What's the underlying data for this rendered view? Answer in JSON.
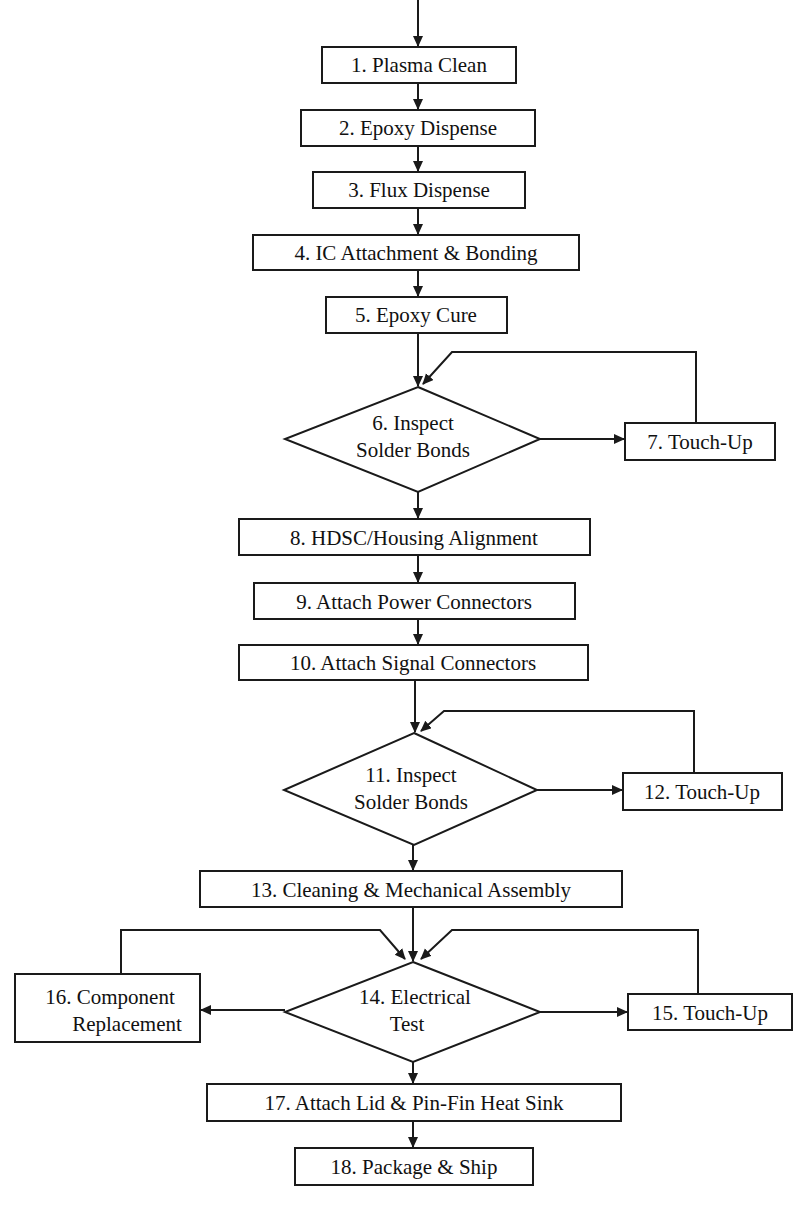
{
  "diagram": {
    "type": "process-flowchart",
    "colors": {
      "line": "#1a1a1a",
      "text": "#111111",
      "background": "#ffffff"
    },
    "nodes": [
      {
        "id": "1",
        "shape": "rect",
        "lines": [
          "1.  Plasma Clean"
        ]
      },
      {
        "id": "2",
        "shape": "rect",
        "lines": [
          "2.  Epoxy Dispense"
        ]
      },
      {
        "id": "3",
        "shape": "rect",
        "lines": [
          "3.  Flux Dispense"
        ]
      },
      {
        "id": "4",
        "shape": "rect",
        "lines": [
          "4.  IC Attachment & Bonding"
        ]
      },
      {
        "id": "5",
        "shape": "rect",
        "lines": [
          "5.  Epoxy Cure"
        ]
      },
      {
        "id": "6",
        "shape": "diamond",
        "lines": [
          "6.  Inspect",
          "Solder Bonds"
        ]
      },
      {
        "id": "7",
        "shape": "rect",
        "lines": [
          "7.  Touch-Up"
        ]
      },
      {
        "id": "8",
        "shape": "rect",
        "lines": [
          "8.  HDSC/Housing Alignment"
        ]
      },
      {
        "id": "9",
        "shape": "rect",
        "lines": [
          "9.  Attach Power Connectors"
        ]
      },
      {
        "id": "10",
        "shape": "rect",
        "lines": [
          "10.  Attach Signal Connectors"
        ]
      },
      {
        "id": "11",
        "shape": "diamond",
        "lines": [
          "11.  Inspect",
          "Solder Bonds"
        ]
      },
      {
        "id": "12",
        "shape": "rect",
        "lines": [
          "12.  Touch-Up"
        ]
      },
      {
        "id": "13",
        "shape": "rect",
        "lines": [
          "13.  Cleaning & Mechanical Assembly"
        ]
      },
      {
        "id": "14",
        "shape": "diamond",
        "lines": [
          "14.  Electrical",
          "Test"
        ]
      },
      {
        "id": "15",
        "shape": "rect",
        "lines": [
          "15.  Touch-Up"
        ]
      },
      {
        "id": "16",
        "shape": "rect",
        "lines": [
          "16.  Component",
          "Replacement"
        ]
      },
      {
        "id": "17",
        "shape": "rect",
        "lines": [
          "17.  Attach Lid & Pin-Fin Heat Sink"
        ]
      },
      {
        "id": "18",
        "shape": "rect",
        "lines": [
          "18.  Package & Ship"
        ]
      }
    ],
    "edges": [
      {
        "from": "start",
        "to": "1"
      },
      {
        "from": "1",
        "to": "2"
      },
      {
        "from": "2",
        "to": "3"
      },
      {
        "from": "3",
        "to": "4"
      },
      {
        "from": "4",
        "to": "5"
      },
      {
        "from": "5",
        "to": "6"
      },
      {
        "from": "6",
        "to": "7"
      },
      {
        "from": "7",
        "to": "6"
      },
      {
        "from": "6",
        "to": "8"
      },
      {
        "from": "8",
        "to": "9"
      },
      {
        "from": "9",
        "to": "10"
      },
      {
        "from": "10",
        "to": "11"
      },
      {
        "from": "11",
        "to": "12"
      },
      {
        "from": "12",
        "to": "11"
      },
      {
        "from": "11",
        "to": "13"
      },
      {
        "from": "13",
        "to": "14"
      },
      {
        "from": "14",
        "to": "15"
      },
      {
        "from": "15",
        "to": "14"
      },
      {
        "from": "14",
        "to": "16"
      },
      {
        "from": "16",
        "to": "14"
      },
      {
        "from": "14",
        "to": "17"
      },
      {
        "from": "17",
        "to": "18"
      }
    ]
  }
}
